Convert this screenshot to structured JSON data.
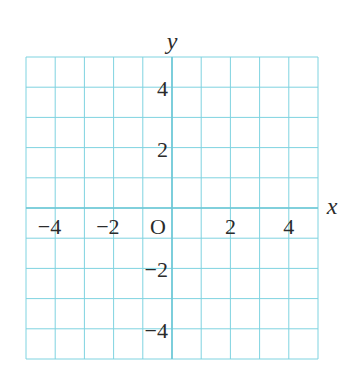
{
  "diagram": {
    "type": "coordinate-grid",
    "grid": {
      "x_min": -5,
      "x_max": 5,
      "y_min": -5,
      "y_max": 5,
      "step": 1,
      "left": 26,
      "top": 57,
      "right": 318,
      "bottom": 359,
      "line_color": "#7fd3e0",
      "axis_color": "#6cc7d6"
    },
    "axes": {
      "x_label": "x",
      "y_label": "y"
    },
    "origin_label": "O",
    "x_tick_labels": [
      {
        "value": -4,
        "text": "−4"
      },
      {
        "value": -2,
        "text": "−2"
      },
      {
        "value": 2,
        "text": "2"
      },
      {
        "value": 4,
        "text": "4"
      }
    ],
    "y_tick_labels": [
      {
        "value": 4,
        "text": "4"
      },
      {
        "value": 2,
        "text": "2"
      },
      {
        "value": -2,
        "text": "−2"
      },
      {
        "value": -4,
        "text": "−4"
      }
    ],
    "text_color": "#2b2b2b"
  }
}
